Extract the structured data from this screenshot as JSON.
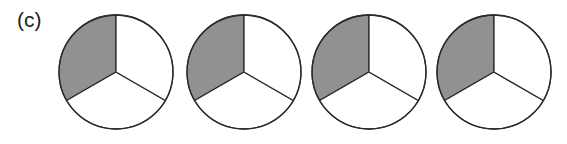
{
  "figure": {
    "panel_label": "(c)",
    "background_color": "#ffffff",
    "width": 567,
    "height": 144
  },
  "style": {
    "shaded_color": "#919191",
    "unshaded_color": "#ffffff",
    "outline_color": "#2b2b2b",
    "label_color": "#231f20",
    "outline_width": 1.3
  },
  "chart_data": {
    "type": "pie",
    "title": "(c)",
    "xlabel": "",
    "ylabel": "",
    "categories": [
      "shaded",
      "unshaded",
      "unshaded"
    ],
    "values": [
      120,
      120,
      120
    ],
    "units": "degrees",
    "slice_fraction": "1/3",
    "shaded_count_per_circle": 1,
    "total_slices_per_circle": 3,
    "total_circles": 4,
    "total_shaded_slices": 4,
    "legend": [],
    "grid": false,
    "charts": [
      {
        "index": 1,
        "center_x": 116,
        "center_y": 72,
        "radius": 57,
        "sectors": [
          {
            "name": "upper-left",
            "start_deg": 90,
            "end_deg": 210,
            "shaded": true
          },
          {
            "name": "bottom",
            "start_deg": 210,
            "end_deg": 330,
            "shaded": false
          },
          {
            "name": "right",
            "start_deg": 330,
            "end_deg": 450,
            "shaded": false
          }
        ]
      },
      {
        "index": 2,
        "center_x": 244,
        "center_y": 72,
        "radius": 57,
        "sectors": [
          {
            "name": "upper-left",
            "start_deg": 90,
            "end_deg": 210,
            "shaded": true
          },
          {
            "name": "bottom",
            "start_deg": 210,
            "end_deg": 330,
            "shaded": false
          },
          {
            "name": "right",
            "start_deg": 330,
            "end_deg": 450,
            "shaded": false
          }
        ]
      },
      {
        "index": 3,
        "center_x": 369,
        "center_y": 72,
        "radius": 57,
        "sectors": [
          {
            "name": "upper-left",
            "start_deg": 90,
            "end_deg": 210,
            "shaded": true
          },
          {
            "name": "bottom",
            "start_deg": 210,
            "end_deg": 330,
            "shaded": false
          },
          {
            "name": "right",
            "start_deg": 330,
            "end_deg": 450,
            "shaded": false
          }
        ]
      },
      {
        "index": 4,
        "center_x": 494,
        "center_y": 72,
        "radius": 57,
        "sectors": [
          {
            "name": "upper-left",
            "start_deg": 90,
            "end_deg": 210,
            "shaded": true
          },
          {
            "name": "bottom",
            "start_deg": 210,
            "end_deg": 330,
            "shaded": false
          },
          {
            "name": "right",
            "start_deg": 330,
            "end_deg": 450,
            "shaded": false
          }
        ]
      }
    ]
  }
}
